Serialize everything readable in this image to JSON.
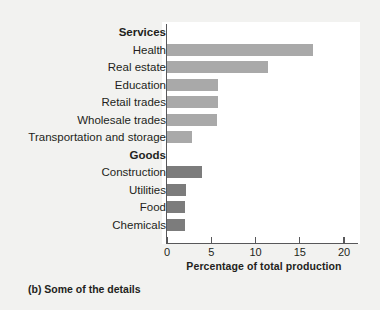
{
  "figure": {
    "caption": "(b) Some of the details",
    "background_color": "#f2f2f0",
    "panel_color": "#ffffff"
  },
  "chart_data": {
    "type": "bar",
    "orientation": "horizontal",
    "title": "",
    "xlabel": "Percentage of total production",
    "ylabel": "",
    "xlim": [
      0,
      21.5
    ],
    "xticks": [
      0,
      5,
      10,
      15,
      20
    ],
    "xtick_labels": [
      "0",
      "5",
      "10",
      "15",
      "20"
    ],
    "grid": false,
    "legend": null,
    "group_headers": [
      "Services",
      "Goods"
    ],
    "colors": {
      "services_bar": "#a9a9a9",
      "goods_bar": "#7c7c7c",
      "axis": "#58585a",
      "text": "#231f20"
    },
    "rows": [
      {
        "kind": "header",
        "label": "Services"
      },
      {
        "kind": "bar",
        "label": "Health",
        "value": 16.5,
        "group": "Services"
      },
      {
        "kind": "bar",
        "label": "Real estate",
        "value": 11.4,
        "group": "Services"
      },
      {
        "kind": "bar",
        "label": "Education",
        "value": 5.8,
        "group": "Services"
      },
      {
        "kind": "bar",
        "label": "Retail trades",
        "value": 5.8,
        "group": "Services"
      },
      {
        "kind": "bar",
        "label": "Wholesale trades",
        "value": 5.6,
        "group": "Services"
      },
      {
        "kind": "bar",
        "label": "Transportation and storage",
        "value": 2.8,
        "group": "Services"
      },
      {
        "kind": "header",
        "label": "Goods"
      },
      {
        "kind": "bar",
        "label": "Construction",
        "value": 3.9,
        "group": "Goods"
      },
      {
        "kind": "bar",
        "label": "Utilities",
        "value": 2.1,
        "group": "Goods"
      },
      {
        "kind": "bar",
        "label": "Food",
        "value": 2.0,
        "group": "Goods"
      },
      {
        "kind": "bar",
        "label": "Chemicals",
        "value": 2.0,
        "group": "Goods"
      }
    ],
    "categories": [
      "Health",
      "Real estate",
      "Education",
      "Retail trades",
      "Wholesale trades",
      "Transportation and storage",
      "Construction",
      "Utilities",
      "Food",
      "Chemicals"
    ],
    "values": [
      16.5,
      11.4,
      5.8,
      5.8,
      5.6,
      2.8,
      3.9,
      2.1,
      2.0,
      2.0
    ]
  }
}
